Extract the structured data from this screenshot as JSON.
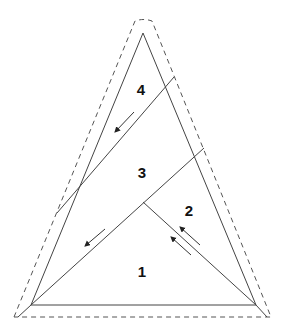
{
  "diagram": {
    "type": "folding-diagram",
    "colors": {
      "line": "#444444",
      "dashed": "#555555",
      "label": "#111111",
      "background": "#ffffff"
    },
    "inner_triangle": [
      [
        143,
        33
      ],
      [
        31,
        305
      ],
      [
        256,
        305
      ]
    ],
    "outer_dashed_outline": {
      "points": [
        [
          135,
          21
        ],
        [
          152,
          21
        ],
        [
          271,
          317
        ],
        [
          14,
          317
        ]
      ]
    },
    "fold_lines": [
      {
        "id": "line-4-3",
        "from": [
          174,
          77
        ],
        "to": [
          57,
          213
        ]
      },
      {
        "id": "line-3-2",
        "from": [
          204,
          148
        ],
        "to": [
          31,
          305
        ]
      },
      {
        "id": "line-2-1",
        "from": [
          143,
          202
        ],
        "to": [
          256,
          305
        ]
      }
    ],
    "arrows": [
      {
        "id": "arrow-region-4",
        "from": [
          134,
          112
        ],
        "to": [
          115,
          132
        ]
      },
      {
        "id": "arrow-region-3",
        "from": [
          105,
          229
        ],
        "to": [
          85,
          246
        ]
      },
      {
        "id": "arrow-region-2a",
        "from": [
          200,
          245
        ],
        "to": [
          180,
          227
        ]
      },
      {
        "id": "arrow-region-2b",
        "from": [
          191,
          255
        ],
        "to": [
          171,
          237
        ]
      }
    ],
    "regions": [
      {
        "label": "4",
        "x": 141,
        "y": 89
      },
      {
        "label": "3",
        "x": 142,
        "y": 172
      },
      {
        "label": "2",
        "x": 189,
        "y": 210
      },
      {
        "label": "1",
        "x": 142,
        "y": 271
      }
    ]
  }
}
